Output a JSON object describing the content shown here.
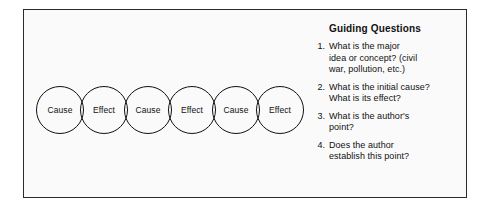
{
  "diagram": {
    "border_color": "#2b2b2b",
    "background_color": "#fafafa",
    "chain": {
      "name": "cause-effect-chain",
      "node_shape": "circle",
      "node_stroke_color": "#111111",
      "nodes": [
        {
          "label": "Cause"
        },
        {
          "label": "Effect"
        },
        {
          "label": "Cause"
        },
        {
          "label": "Effect"
        },
        {
          "label": "Cause"
        },
        {
          "label": "Effect"
        }
      ]
    }
  },
  "questions": {
    "heading": "Guiding Questions",
    "items": [
      {
        "number": "1.",
        "text": "What is the major\nidea or concept? (civil\nwar, pollution, etc.)"
      },
      {
        "number": "2.",
        "text": "What is the initial cause?\nWhat is its effect?"
      },
      {
        "number": "3.",
        "text": "What is the author's\npoint?"
      },
      {
        "number": "4.",
        "text": "Does the author\nestablish this point?"
      }
    ]
  }
}
